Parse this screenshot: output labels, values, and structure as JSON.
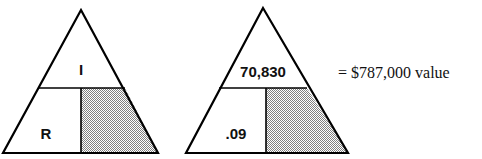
{
  "diagram": {
    "type": "IRV formula triangles",
    "stroke_color": "#000000",
    "shade_color": "#b8b8b8",
    "triangles": [
      {
        "name": "formula",
        "top_label": "I",
        "bottom_left_label": "R",
        "bottom_right_shaded": true
      },
      {
        "name": "worked-example",
        "top_label": "70,830",
        "bottom_left_label": ".09",
        "bottom_right_shaded": true
      }
    ],
    "result": {
      "equals": "=",
      "value": "$787,000",
      "unit": "value",
      "text": "= $787,000 value"
    }
  }
}
